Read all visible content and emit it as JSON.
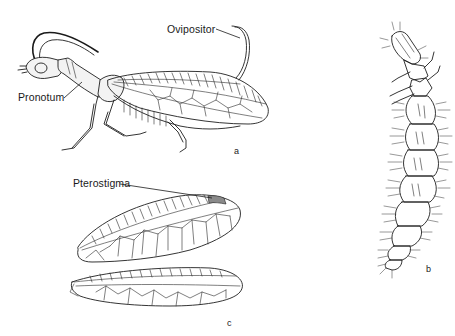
{
  "figure": {
    "panels": [
      {
        "id": "a",
        "letter": "a",
        "subject": "adult-side-view"
      },
      {
        "id": "b",
        "letter": "b",
        "subject": "larva-dorsal-view"
      },
      {
        "id": "c",
        "letter": "c",
        "subject": "fore-and-hind-wings"
      }
    ],
    "labels": {
      "ovipositor": "Ovipositor",
      "pronotum": "Pronotum",
      "pterostigma": "Pterostigma"
    }
  }
}
